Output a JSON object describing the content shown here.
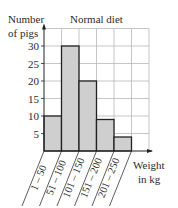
{
  "chart_data": {
    "type": "bar",
    "subtype": "histogram",
    "title": "Normal diet",
    "ylabel": "Number of pigs",
    "ylabel_lines": [
      "Number",
      "of pigs"
    ],
    "xlabel": "Weight in kg",
    "xlabel_lines": [
      "Weight",
      "in kg"
    ],
    "categories": [
      "1 – 50",
      "51 – 100",
      "101 – 150",
      "151 – 200",
      "201 – 250"
    ],
    "values": [
      10,
      30,
      20,
      9,
      4
    ],
    "yticks": [
      5,
      10,
      15,
      20,
      25,
      30
    ],
    "ylim": [
      0,
      35
    ],
    "grid": true,
    "bar_color": "#cfcfcf",
    "legend": null
  }
}
